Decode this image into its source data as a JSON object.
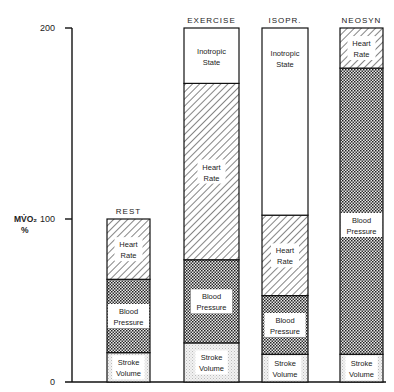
{
  "chart_data": {
    "type": "bar",
    "stacked": true,
    "title": "",
    "xlabel": "",
    "ylabel": "MV̇O₂ %",
    "ylim": [
      0,
      200
    ],
    "yticks": [
      0,
      100,
      200
    ],
    "grid": false,
    "legend": "none (segments labeled inside bars)",
    "categories": [
      "REST",
      "EXERCISE",
      "ISOPR.",
      "NEOSYN"
    ],
    "series": [
      {
        "name": "Stroke Volume",
        "pattern": "light-stipple",
        "values": [
          18,
          24,
          17,
          17
        ]
      },
      {
        "name": "Blood Pressure",
        "pattern": "dense-crosshatch",
        "values": [
          45,
          51,
          36,
          162
        ]
      },
      {
        "name": "Heart Rate",
        "pattern": "diagonal-hatch",
        "values": [
          37,
          96,
          49,
          21
        ]
      },
      {
        "name": "Inotropic State",
        "pattern": "blank",
        "values": [
          0,
          29,
          98,
          0
        ]
      }
    ],
    "segment_labels": {
      "Stroke Volume": [
        "Stroke",
        "Volume"
      ],
      "Blood Pressure": [
        "Blood",
        "Pressure"
      ],
      "Heart Rate": [
        "Heart",
        "Rate"
      ],
      "Inotropic State": [
        "Inotropic",
        "State"
      ]
    },
    "totals": [
      100,
      200,
      200,
      200
    ]
  },
  "axis": {
    "ylabel_line1": "MV̇O₂",
    "ylabel_line2": "%",
    "tick_labels": [
      "0",
      "100",
      "200"
    ]
  }
}
